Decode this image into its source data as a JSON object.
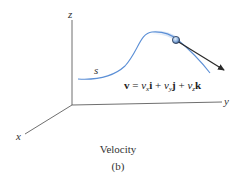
{
  "figure": {
    "caption": "Velocity",
    "sublabel": "(b)",
    "axes": {
      "x_label": "x",
      "y_label": "y",
      "z_label": "z"
    },
    "path_label": "s",
    "equation": {
      "lhs": "v",
      "equals": "=",
      "term1_coef": "v",
      "term1_sub": "x",
      "term1_unit": "i",
      "plus1": "+",
      "term2_coef": "v",
      "term2_sub": "y",
      "term2_unit": "j",
      "plus2": "+",
      "term3_coef": "v",
      "term3_sub": "z",
      "term3_unit": "k"
    },
    "colors": {
      "axis": "#4a4a4a",
      "path": "#5b8fd6",
      "arrow": "#2a2a2a",
      "particle_fill": "#8fb3e0",
      "particle_stroke": "#2a3a55"
    }
  }
}
